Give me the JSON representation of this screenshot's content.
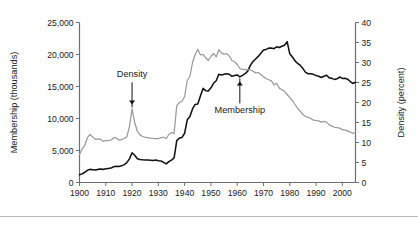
{
  "figure": {
    "background_color": "#ffffff",
    "footer_rule_color": "#b9b9b9"
  },
  "axes": {
    "left": {
      "title": "Membership (thousands)",
      "ticks": [
        "0",
        "5,000",
        "10,000",
        "15,000",
        "20,000",
        "25,000"
      ],
      "min": 0,
      "max": 25000
    },
    "right": {
      "title": "Density (percent)",
      "ticks": [
        "0",
        "5",
        "10",
        "15",
        "20",
        "25",
        "30",
        "35",
        "40"
      ],
      "min": 0,
      "max": 40
    },
    "bottom": {
      "ticks": [
        "1900",
        "1910",
        "1920",
        "1930",
        "1940",
        "1950",
        "1960",
        "1970",
        "1980",
        "1990",
        "2000"
      ],
      "min": 1900,
      "max": 2005
    }
  },
  "annotations": [
    {
      "label": "Density",
      "points_to_year": 1920,
      "direction": "down"
    },
    {
      "label": "Membership",
      "points_to_year": 1961,
      "direction": "up"
    }
  ],
  "chart_data": {
    "type": "line",
    "title": "",
    "xlabel": "",
    "ylabel": "Membership (thousands)",
    "y2label": "Density (percent)",
    "xlim": [
      1900,
      2005
    ],
    "ylim": [
      0,
      25000
    ],
    "y2lim": [
      0,
      40
    ],
    "grid": false,
    "legend": "annotated-inline",
    "x": [
      1900,
      1901,
      1902,
      1903,
      1904,
      1905,
      1906,
      1907,
      1908,
      1909,
      1910,
      1911,
      1912,
      1913,
      1914,
      1915,
      1916,
      1917,
      1918,
      1919,
      1920,
      1921,
      1922,
      1923,
      1924,
      1925,
      1926,
      1927,
      1928,
      1929,
      1930,
      1931,
      1932,
      1933,
      1934,
      1935,
      1936,
      1937,
      1938,
      1939,
      1940,
      1941,
      1942,
      1943,
      1944,
      1945,
      1946,
      1947,
      1948,
      1949,
      1950,
      1951,
      1952,
      1953,
      1954,
      1955,
      1956,
      1957,
      1958,
      1959,
      1960,
      1961,
      1962,
      1963,
      1964,
      1965,
      1966,
      1967,
      1968,
      1969,
      1970,
      1971,
      1972,
      1973,
      1974,
      1975,
      1976,
      1977,
      1978,
      1979,
      1980,
      1981,
      1982,
      1983,
      1984,
      1985,
      1986,
      1987,
      1988,
      1989,
      1990,
      1991,
      1992,
      1993,
      1994,
      1995,
      1996,
      1997,
      1998,
      1999,
      2000,
      2001,
      2002,
      2003,
      2004,
      2005
    ],
    "series": [
      {
        "name": "Membership",
        "axis": "left",
        "units": "thousands",
        "color": "#111111",
        "values": [
          1200,
          1350,
          1600,
          1900,
          2050,
          2000,
          1950,
          2050,
          2100,
          2050,
          2150,
          2200,
          2250,
          2450,
          2550,
          2500,
          2600,
          2800,
          3100,
          3700,
          4650,
          4250,
          3700,
          3600,
          3550,
          3520,
          3500,
          3480,
          3450,
          3500,
          3400,
          3350,
          3150,
          2900,
          3250,
          3500,
          3850,
          6550,
          6950,
          7050,
          7700,
          9800,
          10300,
          11500,
          12200,
          12250,
          13500,
          14700,
          14350,
          14300,
          14800,
          15500,
          15900,
          16900,
          16800,
          16900,
          17000,
          16900,
          16600,
          16700,
          16800,
          16500,
          16750,
          17000,
          17400,
          18300,
          18900,
          19300,
          19700,
          20200,
          20700,
          20800,
          21000,
          21000,
          20900,
          21200,
          21100,
          21300,
          21450,
          22000,
          20100,
          19600,
          19000,
          18600,
          18300,
          17800,
          17200,
          17000,
          17000,
          16900,
          16700,
          16600,
          16400,
          16600,
          16750,
          16350,
          16270,
          16110,
          16210,
          16480,
          16260,
          16280,
          16150,
          15780,
          15470,
          15690
        ],
        "values_axis_right_equivalent": null
      },
      {
        "name": "Density",
        "axis": "right",
        "units": "percent",
        "color": "#9a9a9a",
        "values": [
          7.0,
          8.4,
          9.3,
          11.2,
          12.0,
          11.4,
          10.8,
          10.9,
          10.8,
          10.3,
          10.5,
          10.5,
          10.6,
          11.2,
          11.1,
          10.6,
          10.7,
          11.0,
          11.4,
          14.0,
          18.4,
          15.0,
          12.8,
          11.9,
          11.5,
          11.3,
          11.2,
          11.1,
          11.0,
          11.0,
          11.0,
          11.2,
          11.3,
          11.0,
          12.0,
          12.5,
          12.3,
          19.2,
          20.0,
          20.3,
          21.5,
          25.5,
          26.5,
          30.0,
          32.0,
          33.3,
          31.9,
          32.0,
          31.2,
          30.5,
          31.5,
          32.3,
          31.4,
          33.2,
          32.4,
          32.1,
          32.2,
          31.6,
          30.5,
          30.2,
          29.5,
          28.5,
          28.3,
          28.2,
          28.2,
          28.2,
          27.8,
          27.4,
          27.5,
          27.0,
          26.4,
          26.0,
          25.7,
          25.4,
          24.4,
          24.8,
          23.6,
          23.2,
          22.8,
          22.0,
          21.2,
          20.5,
          19.5,
          18.5,
          17.8,
          17.0,
          16.5,
          16.3,
          16.0,
          15.6,
          15.5,
          15.4,
          15.1,
          15.3,
          15.1,
          14.4,
          14.1,
          13.8,
          13.7,
          13.6,
          13.2,
          13.1,
          12.9,
          12.6,
          12.3,
          12.5
        ]
      }
    ]
  }
}
